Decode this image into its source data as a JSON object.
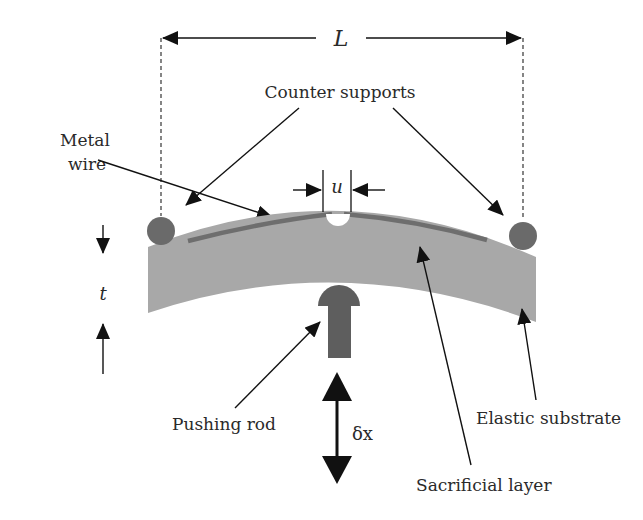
{
  "figure": {
    "labels": {
      "span_length": "L",
      "counter_supports": "Counter supports",
      "metal_wire_line1": "Metal",
      "metal_wire_line2": "wire",
      "gap": "u",
      "thickness": "t",
      "pushing_rod": "Pushing rod",
      "displacement": "δx",
      "elastic_substrate": "Elastic substrate",
      "sacrificial_layer": "Sacrificial layer"
    },
    "colors": {
      "substrate": "#a8a8a8",
      "wire": "#6e6e6e",
      "support": "#6a6a6a",
      "rod": "#5e5e5e",
      "arrow": "#111111",
      "text": "#2a2a2a",
      "background": "#ffffff"
    },
    "components": [
      "counter-support-left",
      "counter-support-right",
      "metal-wire",
      "sacrificial-layer",
      "elastic-substrate",
      "pushing-rod"
    ]
  }
}
